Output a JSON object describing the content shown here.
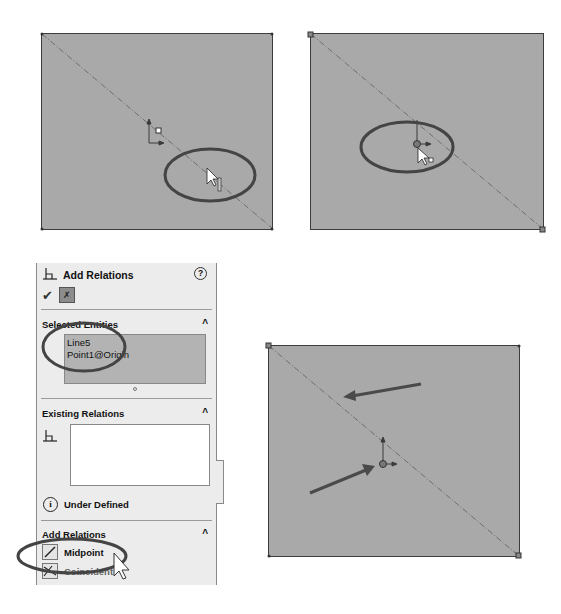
{
  "frames": [
    {
      "name": "step-1",
      "annotation": "ellipse around cursor on line"
    },
    {
      "name": "step-2",
      "annotation": "ellipse around origin point"
    },
    {
      "name": "step-3",
      "annotation": "arrows pointing to line and origin"
    }
  ],
  "panel": {
    "title": "Add Relations",
    "help_glyph": "?",
    "ok_glyph": "✔",
    "pin_glyph": "✗",
    "sections": {
      "selected_entities": {
        "title": "Selected Entities",
        "items": [
          "Line5",
          "Point1@Origin"
        ]
      },
      "existing_relations": {
        "title": "Existing Relations",
        "status_icon_glyph": "i",
        "status_text": "Under Defined"
      },
      "add_relations": {
        "title": "Add Relations",
        "items": [
          {
            "label": "Midpoint",
            "icon": "midpoint-icon"
          },
          {
            "label": "Coincident",
            "icon": "coincident-icon"
          }
        ]
      }
    },
    "collapse_glyph": "^"
  },
  "colors": {
    "sketch_fill": "#a9a9a9",
    "sketch_edge": "#3c3c3c",
    "annotation": "#4a4a4a",
    "panel_bg": "#ececec"
  }
}
